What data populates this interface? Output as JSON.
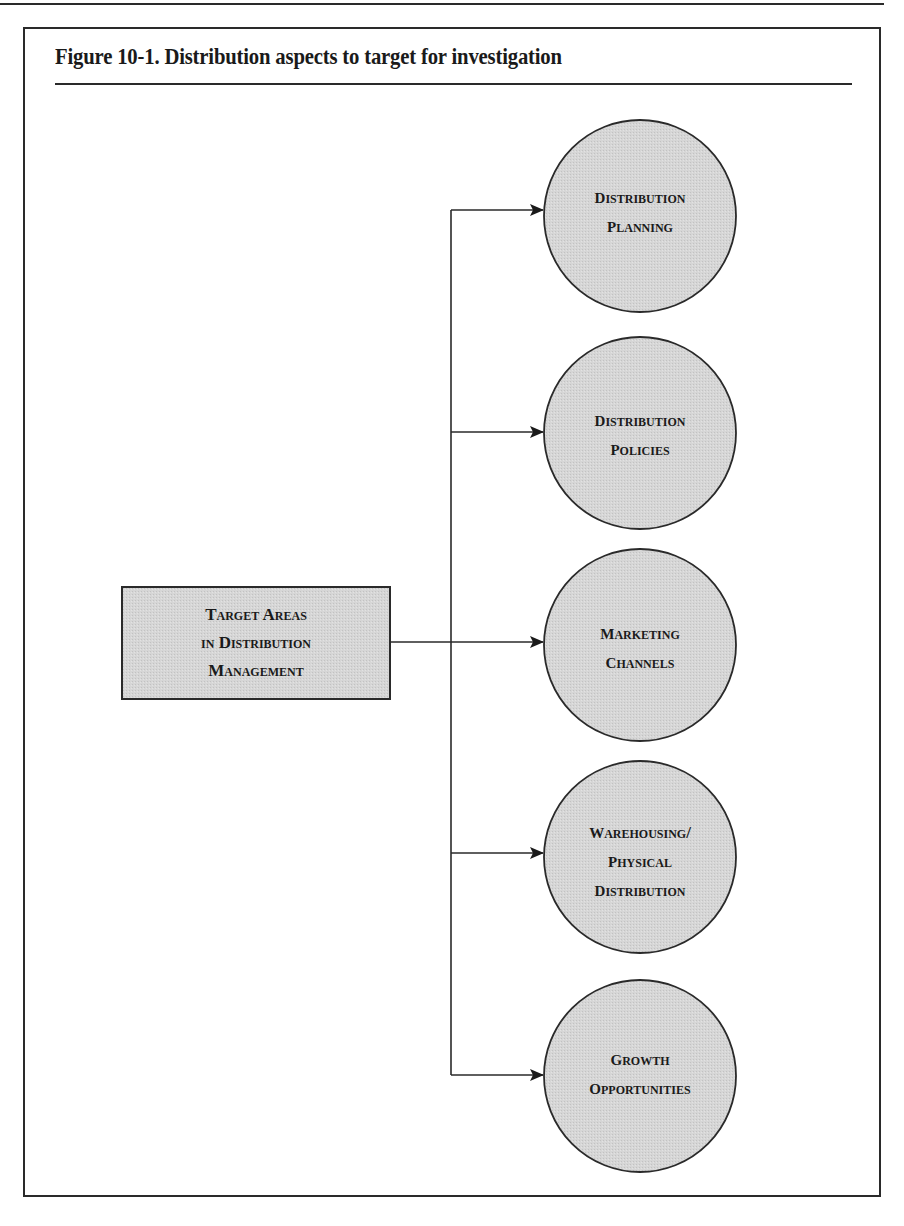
{
  "figure": {
    "title": "Figure 10-1.  Distribution aspects to target for investigation"
  },
  "root": {
    "lines": [
      "Target Areas",
      "in Distribution",
      "Management"
    ]
  },
  "targets": [
    {
      "lines": [
        "Distribution",
        "Planning"
      ]
    },
    {
      "lines": [
        "Distribution",
        "Policies"
      ]
    },
    {
      "lines": [
        "Marketing",
        "Channels"
      ]
    },
    {
      "lines": [
        "Warehousing/",
        "Physical",
        "Distribution"
      ]
    },
    {
      "lines": [
        "Growth",
        "Opportunities"
      ]
    }
  ],
  "colors": {
    "node_fill": "#d4d4d4",
    "stroke": "#2a2a2a",
    "background": "#ffffff"
  }
}
